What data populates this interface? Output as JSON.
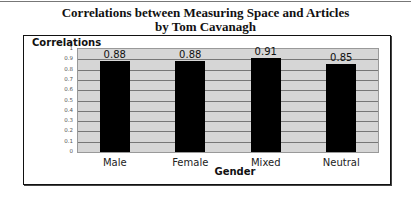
{
  "title_line1": "Correlations between Measuring Space and Articles",
  "title_line2": "by Tom Cavanagh",
  "chart_data": {
    "type": "bar",
    "xlabel": "Gender",
    "ylabel": "Correlations",
    "categories": [
      "Male",
      "Female",
      "Mixed",
      "Neutral"
    ],
    "values": [
      0.88,
      0.88,
      0.91,
      0.85
    ],
    "value_labels": [
      "0.88",
      "0.88",
      "0.91",
      "0.85"
    ],
    "ylim": [
      0,
      1
    ],
    "yticks": [
      "0",
      "0.1",
      "0.2",
      "0.3",
      "0.4",
      "0.5",
      "0.6",
      "0.7",
      "0.8",
      "0.9",
      "1"
    ],
    "grid": true,
    "legend": "none",
    "colors": {
      "bar": "#000000",
      "plot_bg": "#d6d6d6",
      "grid": "#777777"
    }
  }
}
